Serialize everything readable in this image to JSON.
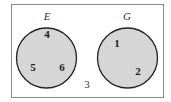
{
  "diagram": {
    "type": "venn",
    "universe": {
      "label": "",
      "outside_elements": [
        {
          "value": "3",
          "x": 87,
          "y": 88
        }
      ]
    },
    "sets": [
      {
        "name": "E",
        "label_x": 47,
        "label_y": 20,
        "cx": 46.5,
        "cy": 58,
        "r": 30,
        "elements": [
          {
            "value": "4",
            "x": 47,
            "y": 38
          },
          {
            "value": "5",
            "x": 33,
            "y": 71
          },
          {
            "value": "6",
            "x": 62,
            "y": 71
          }
        ]
      },
      {
        "name": "G",
        "label_x": 127,
        "label_y": 20,
        "cx": 127.5,
        "cy": 58,
        "r": 30,
        "elements": [
          {
            "value": "1",
            "x": 117,
            "y": 47
          },
          {
            "value": "2",
            "x": 138,
            "y": 75
          }
        ]
      }
    ],
    "colors": {
      "set_fill": "#d6d6d6",
      "set_stroke": "#222222",
      "frame_stroke": "#8a8a8a",
      "background": "#ffffff"
    }
  }
}
